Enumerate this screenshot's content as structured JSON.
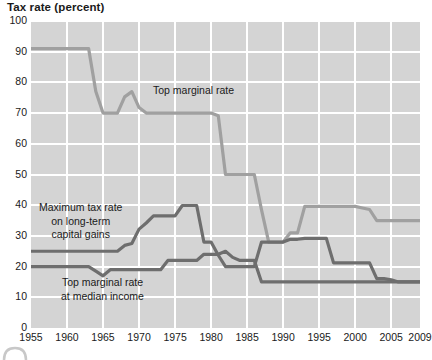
{
  "chart_title": "Tax rate (percent)",
  "axis": {
    "y_ticks": [
      "0",
      "10",
      "20",
      "30",
      "40",
      "50",
      "60",
      "70",
      "80",
      "90",
      "100"
    ],
    "x_ticks": [
      "1955",
      "1960",
      "1965",
      "1970",
      "1975",
      "1980",
      "1985",
      "1990",
      "1995",
      "2000",
      "2005",
      "2009"
    ]
  },
  "labels": {
    "top_marginal": "Top marginal rate",
    "capital_gains_line1": "Maximum tax rate",
    "capital_gains_line2": "on long-term",
    "capital_gains_line3": "capital gains",
    "median_line1": "Top marginal rate",
    "median_line2": "at median income"
  },
  "colors": {
    "plot_background": "#d4d4d4",
    "gridline": "#ffffff",
    "top_marginal_line": "#a0a0a0",
    "capital_gains_line": "#6e6e6e",
    "median_income_line": "#6e6e6e",
    "text": "#1a1a1a"
  },
  "chart_data": {
    "type": "line",
    "title": "Tax rate (percent)",
    "xlabel": "",
    "ylabel": "Tax rate (percent)",
    "xlim": [
      1955,
      2009
    ],
    "ylim": [
      0,
      100
    ],
    "grid": true,
    "legend": "inline-annotations",
    "x_tick_values": [
      1955,
      1960,
      1965,
      1970,
      1975,
      1980,
      1985,
      1990,
      1995,
      2000,
      2005,
      2009
    ],
    "y_tick_values": [
      0,
      10,
      20,
      30,
      40,
      50,
      60,
      70,
      80,
      90,
      100
    ],
    "series": [
      {
        "name": "Top marginal rate",
        "color": "#a0a0a0",
        "points": [
          [
            1955,
            91.0
          ],
          [
            1956,
            91.0
          ],
          [
            1957,
            91.0
          ],
          [
            1958,
            91.0
          ],
          [
            1959,
            91.0
          ],
          [
            1960,
            91.0
          ],
          [
            1961,
            91.0
          ],
          [
            1962,
            91.0
          ],
          [
            1963,
            91.0
          ],
          [
            1964,
            77.0
          ],
          [
            1965,
            70.0
          ],
          [
            1966,
            70.0
          ],
          [
            1967,
            70.0
          ],
          [
            1968,
            75.3
          ],
          [
            1969,
            77.0
          ],
          [
            1970,
            71.8
          ],
          [
            1971,
            70.0
          ],
          [
            1972,
            70.0
          ],
          [
            1973,
            70.0
          ],
          [
            1974,
            70.0
          ],
          [
            1975,
            70.0
          ],
          [
            1976,
            70.0
          ],
          [
            1977,
            70.0
          ],
          [
            1978,
            70.0
          ],
          [
            1979,
            70.0
          ],
          [
            1980,
            70.0
          ],
          [
            1981,
            69.1
          ],
          [
            1982,
            50.0
          ],
          [
            1983,
            50.0
          ],
          [
            1984,
            50.0
          ],
          [
            1985,
            50.0
          ],
          [
            1986,
            50.0
          ],
          [
            1987,
            38.5
          ],
          [
            1988,
            28.0
          ],
          [
            1989,
            28.0
          ],
          [
            1990,
            28.0
          ],
          [
            1991,
            31.0
          ],
          [
            1992,
            31.0
          ],
          [
            1993,
            39.6
          ],
          [
            1994,
            39.6
          ],
          [
            1995,
            39.6
          ],
          [
            1996,
            39.6
          ],
          [
            1997,
            39.6
          ],
          [
            1998,
            39.6
          ],
          [
            1999,
            39.6
          ],
          [
            2000,
            39.6
          ],
          [
            2001,
            39.1
          ],
          [
            2002,
            38.6
          ],
          [
            2003,
            35.0
          ],
          [
            2004,
            35.0
          ],
          [
            2005,
            35.0
          ],
          [
            2006,
            35.0
          ],
          [
            2007,
            35.0
          ],
          [
            2008,
            35.0
          ],
          [
            2009,
            35.0
          ]
        ]
      },
      {
        "name": "Maximum tax rate on long-term capital gains",
        "color": "#6e6e6e",
        "points": [
          [
            1955,
            25.0
          ],
          [
            1956,
            25.0
          ],
          [
            1957,
            25.0
          ],
          [
            1958,
            25.0
          ],
          [
            1959,
            25.0
          ],
          [
            1960,
            25.0
          ],
          [
            1961,
            25.0
          ],
          [
            1962,
            25.0
          ],
          [
            1963,
            25.0
          ],
          [
            1964,
            25.0
          ],
          [
            1965,
            25.0
          ],
          [
            1966,
            25.0
          ],
          [
            1967,
            25.0
          ],
          [
            1968,
            26.9
          ],
          [
            1969,
            27.5
          ],
          [
            1970,
            32.2
          ],
          [
            1971,
            34.2
          ],
          [
            1972,
            36.5
          ],
          [
            1973,
            36.5
          ],
          [
            1974,
            36.5
          ],
          [
            1975,
            36.5
          ],
          [
            1976,
            39.9
          ],
          [
            1977,
            39.9
          ],
          [
            1978,
            39.9
          ],
          [
            1979,
            28.0
          ],
          [
            1980,
            28.0
          ],
          [
            1981,
            23.7
          ],
          [
            1982,
            20.0
          ],
          [
            1983,
            20.0
          ],
          [
            1984,
            20.0
          ],
          [
            1985,
            20.0
          ],
          [
            1986,
            20.0
          ],
          [
            1987,
            28.0
          ],
          [
            1988,
            28.0
          ],
          [
            1989,
            28.0
          ],
          [
            1990,
            28.0
          ],
          [
            1991,
            28.9
          ],
          [
            1992,
            28.9
          ],
          [
            1993,
            29.2
          ],
          [
            1994,
            29.2
          ],
          [
            1995,
            29.2
          ],
          [
            1996,
            29.2
          ],
          [
            1997,
            21.2
          ],
          [
            1998,
            21.2
          ],
          [
            1999,
            21.2
          ],
          [
            2000,
            21.2
          ],
          [
            2001,
            21.2
          ],
          [
            2002,
            21.2
          ],
          [
            2003,
            16.1
          ],
          [
            2004,
            16.1
          ],
          [
            2005,
            15.7
          ],
          [
            2006,
            15.0
          ],
          [
            2007,
            15.0
          ],
          [
            2008,
            15.0
          ],
          [
            2009,
            15.0
          ]
        ]
      },
      {
        "name": "Top marginal rate at median income",
        "color": "#6e6e6e",
        "points": [
          [
            1955,
            20.0
          ],
          [
            1956,
            20.0
          ],
          [
            1957,
            20.0
          ],
          [
            1958,
            20.0
          ],
          [
            1959,
            20.0
          ],
          [
            1960,
            20.0
          ],
          [
            1961,
            20.0
          ],
          [
            1962,
            20.0
          ],
          [
            1963,
            20.0
          ],
          [
            1964,
            18.5
          ],
          [
            1965,
            17.0
          ],
          [
            1966,
            19.0
          ],
          [
            1967,
            19.0
          ],
          [
            1968,
            19.0
          ],
          [
            1969,
            19.0
          ],
          [
            1970,
            19.0
          ],
          [
            1971,
            19.0
          ],
          [
            1972,
            19.0
          ],
          [
            1973,
            19.0
          ],
          [
            1974,
            22.0
          ],
          [
            1975,
            22.0
          ],
          [
            1976,
            22.0
          ],
          [
            1977,
            22.0
          ],
          [
            1978,
            22.0
          ],
          [
            1979,
            24.0
          ],
          [
            1980,
            24.0
          ],
          [
            1981,
            24.0
          ],
          [
            1982,
            25.0
          ],
          [
            1983,
            23.0
          ],
          [
            1984,
            22.0
          ],
          [
            1985,
            22.0
          ],
          [
            1986,
            22.0
          ],
          [
            1987,
            15.0
          ],
          [
            1988,
            15.0
          ],
          [
            1989,
            15.0
          ],
          [
            1990,
            15.0
          ],
          [
            1991,
            15.0
          ],
          [
            1992,
            15.0
          ],
          [
            1993,
            15.0
          ],
          [
            1994,
            15.0
          ],
          [
            1995,
            15.0
          ],
          [
            1996,
            15.0
          ],
          [
            1997,
            15.0
          ],
          [
            1998,
            15.0
          ],
          [
            1999,
            15.0
          ],
          [
            2000,
            15.0
          ],
          [
            2001,
            15.0
          ],
          [
            2002,
            15.0
          ],
          [
            2003,
            15.0
          ],
          [
            2004,
            15.0
          ],
          [
            2005,
            15.0
          ],
          [
            2006,
            15.0
          ],
          [
            2007,
            15.0
          ],
          [
            2008,
            15.0
          ],
          [
            2009,
            15.0
          ]
        ]
      }
    ],
    "annotations": [
      {
        "text": "Top marginal rate",
        "x": 1972.5,
        "y": 74.5
      },
      {
        "text": "Maximum tax rate on long-term capital gains",
        "x": 1958,
        "y": 35
      },
      {
        "text": "Top marginal rate at median income",
        "x": 1961,
        "y": 13
      }
    ]
  }
}
